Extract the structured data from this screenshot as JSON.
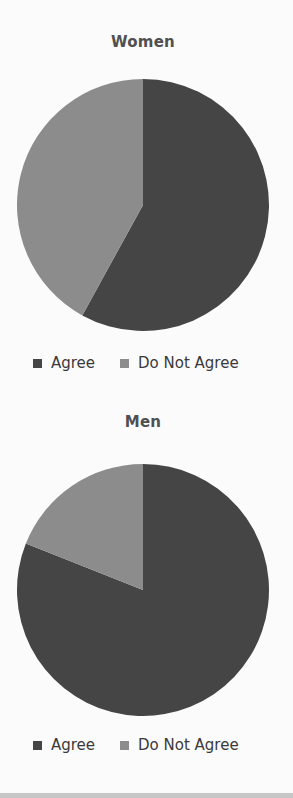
{
  "chart_data": [
    {
      "type": "pie",
      "title": "Women",
      "categories": [
        "Agree",
        "Do Not Agree"
      ],
      "values": [
        58,
        42
      ],
      "colors": [
        "#454545",
        "#8c8c8c"
      ],
      "start_angle_deg": 0,
      "direction": "clockwise",
      "legend": {
        "position": "bottom",
        "entries": [
          "Agree",
          "Do Not Agree"
        ]
      }
    },
    {
      "type": "pie",
      "title": "Men",
      "categories": [
        "Agree",
        "Do Not Agree"
      ],
      "values": [
        81,
        19
      ],
      "colors": [
        "#454545",
        "#8c8c8c"
      ],
      "start_angle_deg": 0,
      "direction": "clockwise",
      "legend": {
        "position": "bottom",
        "entries": [
          "Agree",
          "Do Not Agree"
        ]
      }
    }
  ],
  "charts": {
    "women": {
      "title": "Women",
      "legend": {
        "agree": "Agree",
        "not_agree": "Do Not Agree"
      }
    },
    "men": {
      "title": "Men",
      "legend": {
        "agree": "Agree",
        "not_agree": "Do Not Agree"
      }
    }
  }
}
